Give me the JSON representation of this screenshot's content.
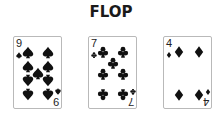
{
  "title": "FLOP",
  "cards": [
    {
      "rank": "9",
      "suit": "spades",
      "color": "#111111"
    },
    {
      "rank": "7",
      "suit": "clubs",
      "color": "#111111"
    },
    {
      "rank": "4",
      "suit": "diamonds",
      "color": "#111111"
    }
  ]
}
